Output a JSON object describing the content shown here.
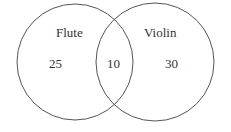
{
  "diagram": {
    "type": "venn",
    "sets": [
      {
        "label": "Flute",
        "only_count": "25"
      },
      {
        "label": "Violin",
        "only_count": "30"
      }
    ],
    "intersection_count": "10",
    "stroke_color": "#555555"
  }
}
